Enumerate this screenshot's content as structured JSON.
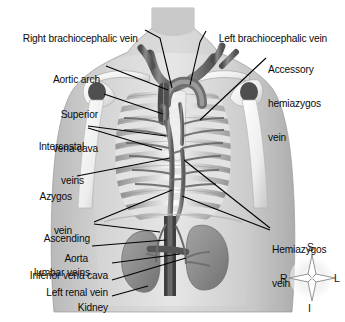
{
  "figure": {
    "style": "grayscale anatomical illustration",
    "background_color": "#ffffff",
    "label_color": "#0b0b0b",
    "leader_line_color": "#000000"
  },
  "labels": [
    {
      "id": "right-brachiocephalic-vein",
      "text": "Right brachiocephalic vein",
      "align": "left",
      "x": 12,
      "y": 22,
      "lines": [
        "Right brachiocephalic vein"
      ]
    },
    {
      "id": "left-brachiocephalic-vein",
      "text": "Left brachiocephalic vein",
      "align": "left",
      "x": 208,
      "y": 22,
      "lines": [
        "Left brachiocephalic vein"
      ]
    },
    {
      "id": "accessory-hemiazygos-vein",
      "text": "Accessory hemiazygos vein",
      "align": "left",
      "x": 268,
      "y": 41,
      "lines": [
        "Accessory",
        "hemiazygos",
        "vein"
      ]
    },
    {
      "id": "aortic-arch",
      "text": "Aortic arch",
      "align": "right",
      "x": 50,
      "y": 63,
      "lines": [
        "Aortic arch"
      ]
    },
    {
      "id": "superior-vena-cava",
      "text": "Superior vena cava",
      "align": "right",
      "x": 28,
      "y": 86,
      "lines": [
        "Superior",
        "vena cava"
      ]
    },
    {
      "id": "intercostal-veins",
      "text": "Intercostal veins",
      "align": "right",
      "x": 18,
      "y": 118,
      "lines": [
        "Intercostal",
        "veins"
      ]
    },
    {
      "id": "azygos-vein",
      "text": "Azygos vein",
      "align": "right",
      "x": 30,
      "y": 168,
      "lines": [
        "Azygos",
        "vein"
      ]
    },
    {
      "id": "ascending-lumbar-veins",
      "text": "Ascending lumbar veins",
      "align": "right",
      "x": 12,
      "y": 210,
      "lines": [
        "Ascending",
        "lumbar veins"
      ]
    },
    {
      "id": "aorta",
      "text": "Aorta",
      "align": "right",
      "x": 62,
      "y": 242,
      "lines": [
        "Aorta"
      ]
    },
    {
      "id": "inferior-vena-cava",
      "text": "Inferior vena cava",
      "align": "right",
      "x": 14,
      "y": 260,
      "lines": [
        "Inferior vena cava"
      ]
    },
    {
      "id": "left-renal-vein",
      "text": "Left renal vein",
      "align": "right",
      "x": 28,
      "y": 277,
      "lines": [
        "Left renal vein"
      ]
    },
    {
      "id": "kidney",
      "text": "Kidney",
      "align": "right",
      "x": 70,
      "y": 292,
      "lines": [
        "Kidney"
      ]
    },
    {
      "id": "hemiazygos-vein",
      "text": "Hemiazygos vein",
      "align": "left",
      "x": 272,
      "y": 222,
      "lines": [
        "Hemiazygos",
        "vein"
      ]
    }
  ],
  "compass": {
    "name": "anatomical-orientation-rose",
    "center_x": 311,
    "center_y": 280,
    "superior": "S",
    "inferior": "I",
    "right": "R",
    "left": "L"
  },
  "anatomy_parts": [
    "body-silhouette",
    "neck",
    "left-shoulder",
    "right-shoulder",
    "clavicle",
    "scapula",
    "humerus",
    "rib-cage",
    "sternum",
    "aortic-arch",
    "superior-vena-cava",
    "brachiocephalic-veins",
    "azygos-vein",
    "hemiazygos-vein",
    "accessory-hemiazygos-vein",
    "intercostal-veins",
    "aorta",
    "inferior-vena-cava",
    "left-renal-vein",
    "right-kidney",
    "left-kidney",
    "ascending-lumbar-veins"
  ]
}
